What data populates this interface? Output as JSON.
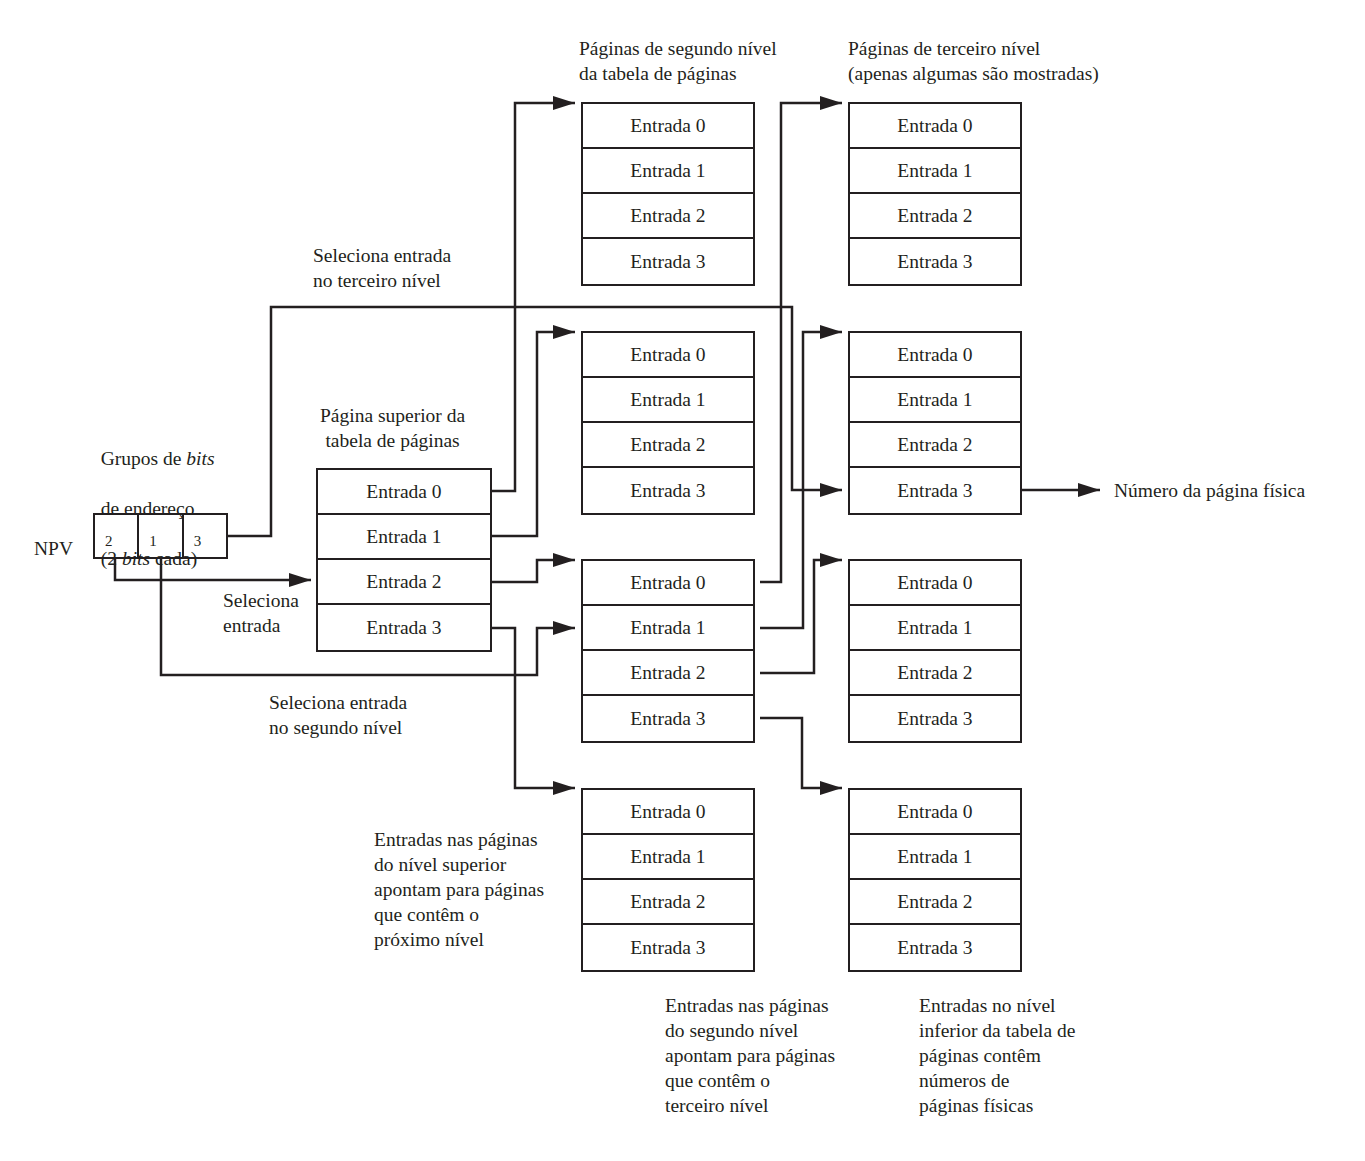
{
  "diagram": {
    "type": "multi-level page table lookup",
    "npv": {
      "label": "NPV",
      "groups": [
        "2",
        "1",
        "3"
      ],
      "caption_line1_a": "Grupos de ",
      "caption_line1_b": "bits",
      "caption_line2": "de endereço",
      "caption_line3_a": "(2 ",
      "caption_line3_b": "bits",
      "caption_line3_c": " cada)"
    },
    "labels": {
      "select_entry_l1": "Seleciona\nentrada",
      "select_entry_l2": "Seleciona entrada\nno segundo nível",
      "select_entry_l3": "Seleciona entrada\nno terceiro nível",
      "top_page_title": "Página superior da\ntabela de páginas",
      "second_level_title": "Páginas de segundo nível\nda tabela de páginas",
      "third_level_title": "Páginas de terceiro nível\n(apenas algumas são mostradas)",
      "physical_page": "Número da página física",
      "note_top": "Entradas nas páginas\ndo nível superior\napontam para páginas\nque contêm o\npróximo nível",
      "note_second": "Entradas nas páginas\ndo segundo nível\napontam para páginas\nque contêm o\nterceiro nível",
      "note_third": "Entradas no nível\ninferior da tabela de\npáginas contêm\nnúmeros de\npáginas físicas"
    },
    "tables": {
      "top": [
        "Entrada 0",
        "Entrada 1",
        "Entrada 2",
        "Entrada 3"
      ],
      "second": [
        [
          "Entrada 0",
          "Entrada 1",
          "Entrada 2",
          "Entrada 3"
        ],
        [
          "Entrada 0",
          "Entrada 1",
          "Entrada 2",
          "Entrada 3"
        ],
        [
          "Entrada 0",
          "Entrada 1",
          "Entrada 2",
          "Entrada 3"
        ],
        [
          "Entrada 0",
          "Entrada 1",
          "Entrada 2",
          "Entrada 3"
        ]
      ],
      "third": [
        [
          "Entrada 0",
          "Entrada 1",
          "Entrada 2",
          "Entrada 3"
        ],
        [
          "Entrada 0",
          "Entrada 1",
          "Entrada 2",
          "Entrada 3"
        ],
        [
          "Entrada 0",
          "Entrada 1",
          "Entrada 2",
          "Entrada 3"
        ],
        [
          "Entrada 0",
          "Entrada 1",
          "Entrada 2",
          "Entrada 3"
        ]
      ]
    },
    "colors": {
      "ink": "#231f20",
      "background": "#ffffff"
    }
  }
}
